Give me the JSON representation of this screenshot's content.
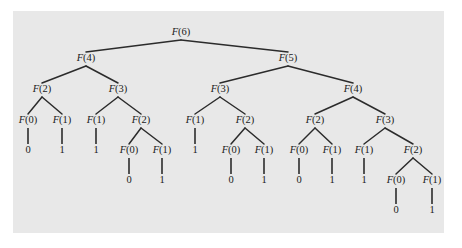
{
  "figure": {
    "kind": "recursion-tree",
    "panel_color": "#e8e8e8",
    "page_color": "#ffffff",
    "edge_color": "#2b2b2b",
    "text_color": "#1a1a1a"
  },
  "chart_data": {
    "type": "diagram",
    "root": "F(6)",
    "levels": 7,
    "node_count": 45,
    "call_nodes": [
      "F(6)",
      "F(4)",
      "F(5)",
      "F(2)",
      "F(3)",
      "F(3)",
      "F(4)",
      "F(0)",
      "F(1)",
      "F(1)",
      "F(2)",
      "F(1)",
      "F(2)",
      "F(2)",
      "F(3)",
      "F(0)",
      "F(1)",
      "F(0)",
      "F(1)",
      "F(0)",
      "F(1)",
      "F(1)",
      "F(2)",
      "F(0)",
      "F(1)"
    ],
    "base_case_values": [
      "0",
      "1",
      "1",
      "0",
      "1",
      "1",
      "0",
      "1",
      "0",
      "1",
      "1",
      "0",
      "1"
    ]
  },
  "nodes": [
    {
      "id": "n0",
      "label": "F(6)",
      "base": "F",
      "arg": "(6)",
      "x": 181,
      "y": 33,
      "type": "call"
    },
    {
      "id": "n1",
      "label": "F(4)",
      "base": "F",
      "arg": "(4)",
      "x": 86,
      "y": 59,
      "type": "call"
    },
    {
      "id": "n2",
      "label": "F(5)",
      "base": "F",
      "arg": "(5)",
      "x": 288,
      "y": 59,
      "type": "call"
    },
    {
      "id": "n3",
      "label": "F(2)",
      "base": "F",
      "arg": "(2)",
      "x": 42,
      "y": 90,
      "type": "call"
    },
    {
      "id": "n4",
      "label": "F(3)",
      "base": "F",
      "arg": "(3)",
      "x": 118,
      "y": 90,
      "type": "call"
    },
    {
      "id": "n5",
      "label": "F(3)",
      "base": "F",
      "arg": "(3)",
      "x": 220,
      "y": 90,
      "type": "call"
    },
    {
      "id": "n6",
      "label": "F(4)",
      "base": "F",
      "arg": "(4)",
      "x": 353,
      "y": 90,
      "type": "call"
    },
    {
      "id": "n7",
      "label": "F(0)",
      "base": "F",
      "arg": "(0)",
      "x": 28,
      "y": 121,
      "type": "call"
    },
    {
      "id": "n8",
      "label": "F(1)",
      "base": "F",
      "arg": "(1)",
      "x": 62,
      "y": 121,
      "type": "call"
    },
    {
      "id": "n9",
      "label": "F(1)",
      "base": "F",
      "arg": "(1)",
      "x": 96,
      "y": 121,
      "type": "call"
    },
    {
      "id": "n10",
      "label": "F(2)",
      "base": "F",
      "arg": "(2)",
      "x": 141,
      "y": 121,
      "type": "call"
    },
    {
      "id": "n11",
      "label": "F(1)",
      "base": "F",
      "arg": "(1)",
      "x": 195,
      "y": 121,
      "type": "call"
    },
    {
      "id": "n12",
      "label": "F(2)",
      "base": "F",
      "arg": "(2)",
      "x": 245,
      "y": 121,
      "type": "call"
    },
    {
      "id": "n13",
      "label": "F(2)",
      "base": "F",
      "arg": "(2)",
      "x": 315,
      "y": 121,
      "type": "call"
    },
    {
      "id": "n14",
      "label": "F(3)",
      "base": "F",
      "arg": "(3)",
      "x": 385,
      "y": 121,
      "type": "call"
    },
    {
      "id": "n15",
      "label": "0",
      "x": 28,
      "y": 151,
      "type": "value"
    },
    {
      "id": "n16",
      "label": "1",
      "x": 62,
      "y": 151,
      "type": "value"
    },
    {
      "id": "n17",
      "label": "1",
      "x": 96,
      "y": 151,
      "type": "value"
    },
    {
      "id": "n18",
      "label": "F(0)",
      "base": "F",
      "arg": "(0)",
      "x": 129,
      "y": 151,
      "type": "call"
    },
    {
      "id": "n19",
      "label": "F(1)",
      "base": "F",
      "arg": "(1)",
      "x": 162,
      "y": 151,
      "type": "call"
    },
    {
      "id": "n20",
      "label": "1",
      "x": 195,
      "y": 151,
      "type": "value"
    },
    {
      "id": "n21",
      "label": "F(0)",
      "base": "F",
      "arg": "(0)",
      "x": 231,
      "y": 151,
      "type": "call"
    },
    {
      "id": "n22",
      "label": "F(1)",
      "base": "F",
      "arg": "(1)",
      "x": 264,
      "y": 151,
      "type": "call"
    },
    {
      "id": "n23",
      "label": "F(0)",
      "base": "F",
      "arg": "(0)",
      "x": 299,
      "y": 151,
      "type": "call"
    },
    {
      "id": "n24",
      "label": "F(1)",
      "base": "F",
      "arg": "(1)",
      "x": 332,
      "y": 151,
      "type": "call"
    },
    {
      "id": "n25",
      "label": "F(1)",
      "base": "F",
      "arg": "(1)",
      "x": 364,
      "y": 151,
      "type": "call"
    },
    {
      "id": "n26",
      "label": "F(2)",
      "base": "F",
      "arg": "(2)",
      "x": 413,
      "y": 151,
      "type": "call"
    },
    {
      "id": "n27",
      "label": "0",
      "x": 129,
      "y": 181,
      "type": "value"
    },
    {
      "id": "n28",
      "label": "1",
      "x": 162,
      "y": 181,
      "type": "value"
    },
    {
      "id": "n29",
      "label": "0",
      "x": 231,
      "y": 181,
      "type": "value"
    },
    {
      "id": "n30",
      "label": "1",
      "x": 264,
      "y": 181,
      "type": "value"
    },
    {
      "id": "n31",
      "label": "0",
      "x": 299,
      "y": 181,
      "type": "value"
    },
    {
      "id": "n32",
      "label": "1",
      "x": 332,
      "y": 181,
      "type": "value"
    },
    {
      "id": "n33",
      "label": "1",
      "x": 364,
      "y": 181,
      "type": "value"
    },
    {
      "id": "n34",
      "label": "F(0)",
      "base": "F",
      "arg": "(0)",
      "x": 396,
      "y": 181,
      "type": "call"
    },
    {
      "id": "n35",
      "label": "F(1)",
      "base": "F",
      "arg": "(1)",
      "x": 432,
      "y": 181,
      "type": "call"
    },
    {
      "id": "n36",
      "label": "0",
      "x": 396,
      "y": 211,
      "type": "value"
    },
    {
      "id": "n37",
      "label": "1",
      "x": 432,
      "y": 211,
      "type": "value"
    }
  ],
  "edges": [
    {
      "from": "n0",
      "to": "n1"
    },
    {
      "from": "n0",
      "to": "n2"
    },
    {
      "from": "n1",
      "to": "n3"
    },
    {
      "from": "n1",
      "to": "n4"
    },
    {
      "from": "n2",
      "to": "n5"
    },
    {
      "from": "n2",
      "to": "n6"
    },
    {
      "from": "n3",
      "to": "n7"
    },
    {
      "from": "n3",
      "to": "n8"
    },
    {
      "from": "n4",
      "to": "n9"
    },
    {
      "from": "n4",
      "to": "n10"
    },
    {
      "from": "n5",
      "to": "n11"
    },
    {
      "from": "n5",
      "to": "n12"
    },
    {
      "from": "n6",
      "to": "n13"
    },
    {
      "from": "n6",
      "to": "n14"
    },
    {
      "from": "n7",
      "to": "n15"
    },
    {
      "from": "n8",
      "to": "n16"
    },
    {
      "from": "n9",
      "to": "n17"
    },
    {
      "from": "n10",
      "to": "n18"
    },
    {
      "from": "n10",
      "to": "n19"
    },
    {
      "from": "n11",
      "to": "n20"
    },
    {
      "from": "n12",
      "to": "n21"
    },
    {
      "from": "n12",
      "to": "n22"
    },
    {
      "from": "n13",
      "to": "n23"
    },
    {
      "from": "n13",
      "to": "n24"
    },
    {
      "from": "n14",
      "to": "n25"
    },
    {
      "from": "n14",
      "to": "n26"
    },
    {
      "from": "n18",
      "to": "n27"
    },
    {
      "from": "n19",
      "to": "n28"
    },
    {
      "from": "n21",
      "to": "n29"
    },
    {
      "from": "n22",
      "to": "n30"
    },
    {
      "from": "n23",
      "to": "n31"
    },
    {
      "from": "n24",
      "to": "n32"
    },
    {
      "from": "n25",
      "to": "n33"
    },
    {
      "from": "n26",
      "to": "n34"
    },
    {
      "from": "n26",
      "to": "n35"
    },
    {
      "from": "n34",
      "to": "n36"
    },
    {
      "from": "n35",
      "to": "n37"
    }
  ]
}
